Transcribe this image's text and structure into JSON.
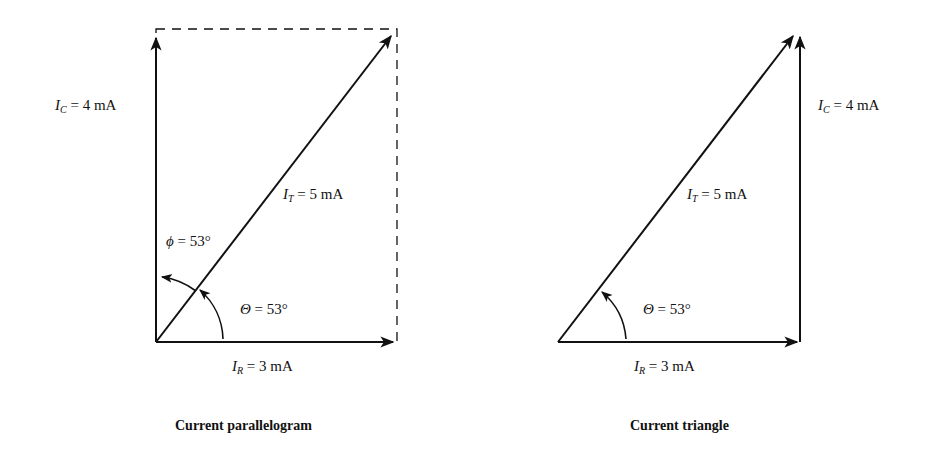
{
  "diagrams": [
    {
      "caption": "Current parallelogram",
      "labels": {
        "ic": {
          "sym": "I",
          "sub": "C",
          "rest": " = 4 mA"
        },
        "it": {
          "sym": "I",
          "sub": "T",
          "rest": " = 5 mA"
        },
        "ir": {
          "sym": "I",
          "sub": "R",
          "rest": " = 3 mA"
        },
        "phi": {
          "sym": "ϕ",
          "rest": " = 53°"
        },
        "theta": {
          "sym": "Θ",
          "rest": " = 53°"
        }
      }
    },
    {
      "caption": "Current triangle",
      "labels": {
        "ic": {
          "sym": "I",
          "sub": "C",
          "rest": " = 4 mA"
        },
        "it": {
          "sym": "I",
          "sub": "T",
          "rest": " = 5 mA"
        },
        "ir": {
          "sym": "I",
          "sub": "R",
          "rest": " = 3 mA"
        },
        "theta": {
          "sym": "Θ",
          "rest": " = 53°"
        }
      }
    }
  ],
  "colors": {
    "stroke": "#111111",
    "background": "#ffffff"
  }
}
